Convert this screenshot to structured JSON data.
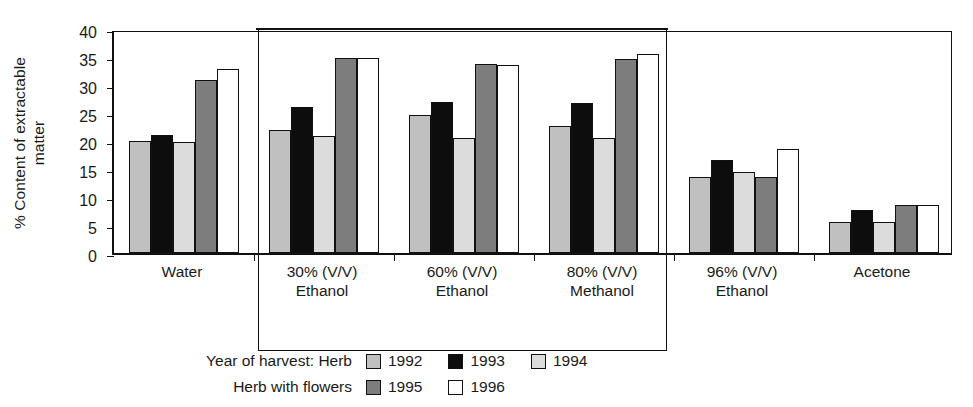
{
  "chart_data": {
    "type": "bar",
    "title": "",
    "xlabel": "",
    "ylabel": "% Content of extractable matter",
    "ylabel_line1": "% Content of extractable",
    "ylabel_line2": "matter",
    "ylim": [
      0,
      40
    ],
    "ytick_step": 5,
    "yticks": [
      "40",
      "35",
      "30",
      "25",
      "20",
      "15",
      "10",
      "5",
      "0"
    ],
    "grid": false,
    "legend_position": "below-chart",
    "categories": [
      {
        "line1": "Water",
        "line2": ""
      },
      {
        "line1": "30% (V/V)",
        "line2": "Ethanol"
      },
      {
        "line1": "60% (V/V)",
        "line2": "Ethanol"
      },
      {
        "line1": "80% (V/V)",
        "line2": "Methanol"
      },
      {
        "line1": "96% (V/V)",
        "line2": "Ethanol"
      },
      {
        "line1": "Acetone",
        "line2": ""
      }
    ],
    "series": [
      {
        "name": "1992",
        "group": "Herb",
        "color": "#c0c0c0",
        "swatch": "sw-1992",
        "values": [
          20.0,
          22.0,
          24.7,
          22.7,
          13.6,
          5.5
        ]
      },
      {
        "name": "1993",
        "group": "Herb",
        "color": "#0d0d0d",
        "swatch": "sw-1993",
        "values": [
          21.1,
          26.1,
          26.9,
          26.8,
          16.6,
          7.7
        ]
      },
      {
        "name": "1994",
        "group": "Herb",
        "color": "#dcdcdc",
        "swatch": "sw-1994",
        "values": [
          19.9,
          20.9,
          20.6,
          20.6,
          14.5,
          5.5
        ]
      },
      {
        "name": "1995",
        "group": "Herb with flowers",
        "color": "#7d7d7d",
        "swatch": "sw-1995",
        "values": [
          30.9,
          34.9,
          33.7,
          34.7,
          13.6,
          8.6
        ]
      },
      {
        "name": "1996",
        "group": "Herb with flowers",
        "color": "#ffffff",
        "swatch": "sw-1996",
        "values": [
          32.9,
          34.9,
          33.6,
          35.5,
          18.6,
          8.6
        ]
      }
    ],
    "annotations": [
      {
        "kind": "highlight-rectangle",
        "covers": [
          "30% (V/V) Ethanol",
          "60% (V/V) Ethanol",
          "80% (V/V) Methanol"
        ]
      }
    ]
  },
  "legend": {
    "row1_title": "Year of harvest: Herb",
    "row2_title": "Herb with flowers",
    "row1_entries": [
      {
        "label": "1992",
        "swatch": "sw-1992"
      },
      {
        "label": "1993",
        "swatch": "sw-1993"
      },
      {
        "label": "1994",
        "swatch": "sw-1994"
      }
    ],
    "row2_entries": [
      {
        "label": "1995",
        "swatch": "sw-1995"
      },
      {
        "label": "1996",
        "swatch": "sw-1996"
      }
    ]
  }
}
